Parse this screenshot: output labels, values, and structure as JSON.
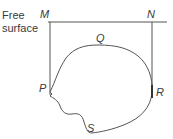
{
  "diagram": {
    "labels": {
      "free": "Free",
      "surface": "surface",
      "M": "M",
      "N": "N",
      "Q": "Q",
      "P": "P",
      "R": "R",
      "S": "S"
    },
    "colors": {
      "stroke": "#555555",
      "text": "#3a3a3a",
      "background": "#ffffff"
    }
  }
}
